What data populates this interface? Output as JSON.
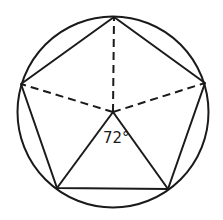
{
  "diagram": {
    "stroke_color": "#1a1a1a",
    "background": "#ffffff",
    "circle": {
      "cx": 113,
      "cy": 112,
      "r": 95.5
    },
    "center": {
      "x": 113,
      "y": 112
    },
    "vertices": [
      {
        "name": "top",
        "x": 114,
        "y": 17
      },
      {
        "name": "right",
        "x": 205,
        "y": 83
      },
      {
        "name": "bottom-right",
        "x": 168,
        "y": 189
      },
      {
        "name": "bottom-left",
        "x": 57,
        "y": 188
      },
      {
        "name": "left",
        "x": 21,
        "y": 84
      }
    ],
    "dashed_radii_to": [
      "top",
      "right",
      "left"
    ],
    "solid_radii_to": [
      "bottom-left",
      "bottom-right"
    ],
    "angle_label": "72°"
  }
}
